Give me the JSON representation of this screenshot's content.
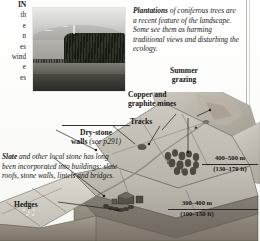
{
  "page": {
    "kind": "illustrated-book-page",
    "background_hex": "#fdfdfc",
    "ink_hex": "#171513"
  },
  "body_column_fragment": {
    "note": "left body-text column cropped by the page edge; only word-ends are visible",
    "lines": [
      "IN",
      "th",
      "e",
      "",
      "n",
      "",
      "es",
      "wind",
      "e",
      "es"
    ]
  },
  "photo": {
    "name": "hillside-conifer-plantation-photo",
    "alt": "Black and white photograph of an upland fell with a dark rectangular conifer plantation on its flank"
  },
  "captions": {
    "plantations": {
      "runin": "Plantations",
      "text": " of coniferous trees are a recent feature of the landscape. Some see them as harming traditional views and disturbing the ecology."
    },
    "slate": {
      "runin": "Slate",
      "text": " and other local stone has long been incorporated into buildings: slate roofs, stone walls, lintels and bridges."
    }
  },
  "labels": {
    "summer_grazing": "Summer\ngrazing",
    "summer_grazing_line1": "Summer",
    "summer_grazing_line2": "grazing",
    "copper_line1": "Copper and",
    "copper_line2": "graphite mines",
    "tracks": "Tracks",
    "drystone_line1": "Dry-stone",
    "drystone_line2_bold": "walls ",
    "drystone_line2_ital": "(see p291)",
    "hedges": "Hedges"
  },
  "elevations": [
    {
      "metric": "400–500 m",
      "imperial": "(130–170 ft)"
    },
    {
      "metric": "300–400 m",
      "imperial": "(100–150 ft)"
    }
  ],
  "diagram": {
    "name": "landscape-cross-section"
  }
}
